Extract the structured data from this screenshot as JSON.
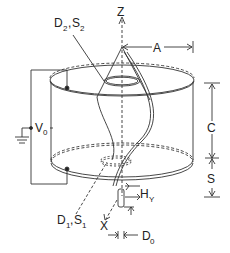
{
  "diagram": {
    "type": "apparatus schematic",
    "labels": {
      "z_axis": "Z",
      "x_axis": "X",
      "radius": "A",
      "height_c": "C",
      "spacing_s": "S",
      "top_aperture_main": "D",
      "top_aperture_main_sub": "2",
      "top_aperture_sep": ",",
      "top_aperture_s": "S",
      "top_aperture_s_sub": "2",
      "bottom_aperture_main": "D",
      "bottom_aperture_main_sub": "1",
      "bottom_aperture_sep": ",",
      "bottom_aperture_s": "S",
      "bottom_aperture_s_sub": "1",
      "voltage": "V",
      "voltage_sub": "0",
      "source_height": "H",
      "source_height_sub": "Y",
      "source_diameter": "D",
      "source_diameter_sub": "0"
    },
    "colors": {
      "line": "#333333",
      "background": "#ffffff"
    }
  }
}
